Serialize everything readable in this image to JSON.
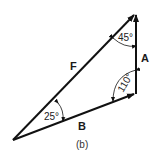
{
  "diagram": {
    "caption": "(b)",
    "vectors": [
      {
        "name": "F",
        "label": "F"
      },
      {
        "name": "A",
        "label": "A"
      },
      {
        "name": "B",
        "label": "B"
      }
    ],
    "angles": [
      {
        "vertex": "top",
        "value": "45°"
      },
      {
        "vertex": "bottom-right",
        "value": "110°"
      },
      {
        "vertex": "left",
        "value": "25°"
      }
    ],
    "colors": {
      "line": "#111111",
      "background": "#ffffff"
    }
  }
}
